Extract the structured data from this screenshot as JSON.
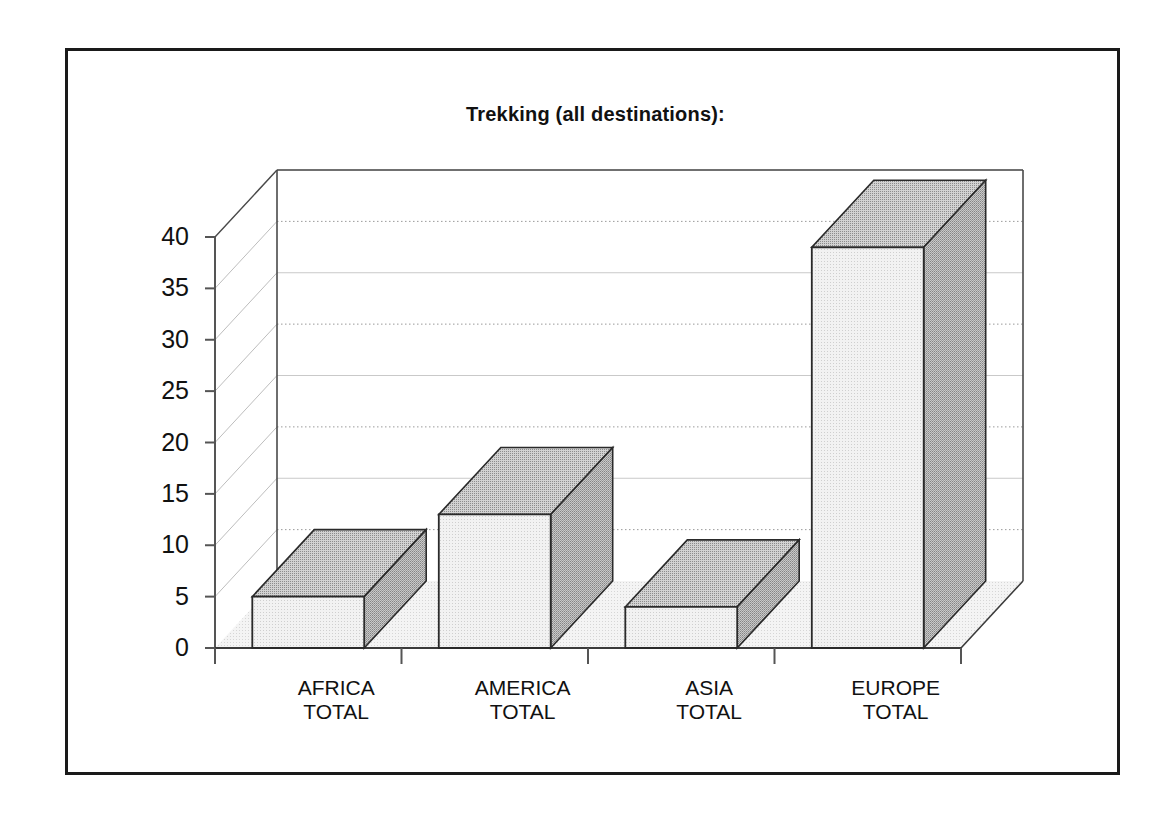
{
  "chart_data": {
    "type": "bar",
    "title": "Trekking  (all destinations):",
    "subtitle": "",
    "xlabel": "",
    "ylabel": "",
    "categories": [
      "AFRICA TOTAL",
      "AMERICA TOTAL",
      "ASIA TOTAL",
      "EUROPE TOTAL"
    ],
    "category_lines": [
      [
        "AFRICA",
        "TOTAL"
      ],
      [
        "AMERICA",
        "TOTAL"
      ],
      [
        "ASIA",
        "TOTAL"
      ],
      [
        "EUROPE",
        "TOTAL"
      ]
    ],
    "values": [
      5,
      13,
      4,
      39
    ],
    "ylim": [
      0,
      40
    ],
    "ytick_labels": [
      "0",
      "5",
      "10",
      "15",
      "20",
      "25",
      "30",
      "35",
      "40"
    ],
    "ytick_values": [
      0,
      5,
      10,
      15,
      20,
      25,
      30,
      35,
      40
    ],
    "grid": true,
    "grid_style": "alternating solid and dotted horizontal lines",
    "legend": "none",
    "projection": "3d-isometric-columns",
    "colors": {
      "bar_front": "#e9e9e9",
      "bar_top": "#b4b4b4",
      "bar_side": "#a9a9a9",
      "bar_outline": "#2a2a2a",
      "floor": "#efefef",
      "grid_solid": "#c9c9c9",
      "grid_dotted": "#9a9a9a",
      "axis": "#555555",
      "frame": "#1a1a1a",
      "text": "#111111"
    }
  },
  "axes": {
    "y_axis_name": "value-axis",
    "x_axis_name": "category-axis"
  }
}
